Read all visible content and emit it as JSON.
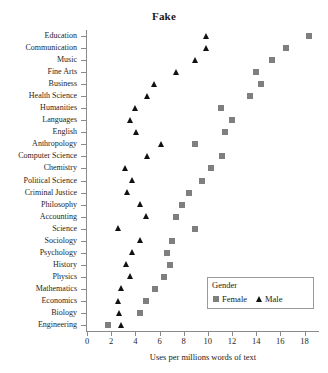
{
  "chart_data": {
    "type": "scatter",
    "title": "Fake",
    "xlabel": "Uses per millions words of text",
    "ylabel": "",
    "xlim": [
      0,
      19.2
    ],
    "xticks": [
      0,
      2,
      4,
      6,
      8,
      10,
      12,
      14,
      16,
      18
    ],
    "xticklabels": [
      "0",
      "2",
      "4",
      "6",
      "8",
      "10",
      "12",
      "14",
      "16",
      "18"
    ],
    "grid": false,
    "legend": {
      "title": "Gender",
      "position": "inside-lower-right",
      "entries": [
        {
          "name": "Female",
          "marker": "square",
          "color": "#7f7f7f"
        },
        {
          "name": "Male",
          "marker": "triangle",
          "color": "#111111"
        }
      ]
    },
    "categories": [
      "Education",
      "Communication",
      "Music",
      "Fine Arts",
      "Business",
      "Health Science",
      "Humanities",
      "Languages",
      "English",
      "Anthropology",
      "Computer Science",
      "Chemistry",
      "Political Science",
      "Criminal Justice",
      "Philosophy",
      "Accounting",
      "Science",
      "Sociology",
      "Psychology",
      "History",
      "Physics",
      "Mathematics",
      "Economics",
      "Biology",
      "Engineering"
    ],
    "series": [
      {
        "name": "Female",
        "marker": "square",
        "color": "#7f7f7f",
        "values": [
          18.4,
          16.5,
          15.3,
          14.0,
          14.4,
          13.5,
          11.1,
          12.0,
          11.4,
          8.9,
          11.2,
          10.3,
          9.5,
          8.4,
          7.9,
          7.4,
          8.9,
          7.0,
          6.6,
          6.9,
          6.4,
          5.6,
          4.9,
          4.4,
          1.7
        ]
      },
      {
        "name": "Male",
        "marker": "triangle",
        "color": "#111111",
        "values": [
          9.9,
          9.9,
          9.0,
          7.4,
          5.6,
          5.0,
          4.0,
          3.6,
          4.1,
          6.2,
          5.0,
          3.2,
          3.8,
          3.4,
          4.4,
          4.9,
          2.6,
          4.4,
          3.8,
          3.3,
          3.6,
          2.9,
          2.6,
          2.7,
          2.9
        ]
      }
    ]
  }
}
